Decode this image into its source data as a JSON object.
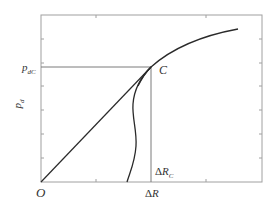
{
  "diagram": {
    "labels": {
      "origin": "O",
      "y_axis": "p",
      "y_axis_sub": "d",
      "y_marker": "p",
      "y_marker_sub": "dC",
      "point": "C",
      "x_axis_prefix": "Δ",
      "x_axis": "R",
      "x_marker_prefix": "Δ",
      "x_marker": "R",
      "x_marker_sub": "C"
    },
    "colors": {
      "frame": "#a0a0a0",
      "curve": "#2a2a2a",
      "guide": "#7a7a7a",
      "background": "#ffffff"
    },
    "curves": [
      {
        "name": "linear-elastic-line",
        "from": "O",
        "to": "C"
      },
      {
        "name": "upper-response-curve",
        "description": "concave rising curve passing through C"
      },
      {
        "name": "lower-descending-curve",
        "description": "S-shaped curve from C down to the ΔR axis"
      }
    ]
  }
}
